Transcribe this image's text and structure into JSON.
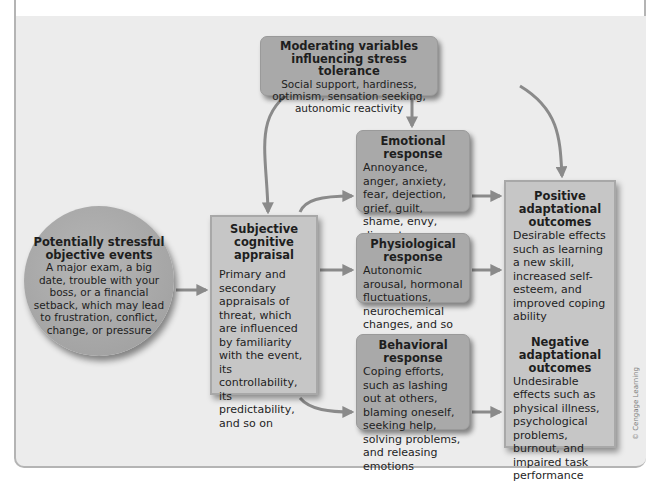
{
  "diagram": {
    "moderating": {
      "title": "Moderating variables influencing stress tolerance",
      "body": "Social support, hardiness, optimism, sensation seeking, autonomic reactivity"
    },
    "events": {
      "title": "Potentially stressful objective events",
      "body": "A major exam, a big date, trouble with your boss, or a financial setback, which may lead to frustration, conflict, change, or pressure"
    },
    "appraisal": {
      "title": "Subjective cognitive appraisal",
      "body": "Primary and secondary appraisals of threat, which are influenced by familiarity with the event, its controllability, its predictability, and so on"
    },
    "emotional": {
      "title": "Emotional response",
      "body": "Annoyance, anger, anxiety, fear, dejection, grief, guilt, shame, envy, disgust"
    },
    "physiological": {
      "title": "Physiological response",
      "body": "Autonomic arousal, hormonal fluctuations, neurochemical changes, and so on"
    },
    "behavioral": {
      "title": "Behavioral response",
      "body": "Coping efforts, such as lashing out at others, blaming oneself, seeking help, solving problems, and releasing emotions"
    },
    "positive": {
      "title": "Positive adaptational outcomes",
      "body": "Desirable effects such as learning a new skill, increased self-esteem, and improved coping ability"
    },
    "negative": {
      "title": "Negative adaptational outcomes",
      "body": "Undesirable effects such as physical illness, psychological problems, burnout, and impaired task performance"
    },
    "credit": "© Cengage Learning"
  },
  "colors": {
    "box_fill": "#a9a9a9",
    "light_box_fill": "#c6c6c6",
    "arrow": "#8a8a8a",
    "background": "#ececec"
  }
}
